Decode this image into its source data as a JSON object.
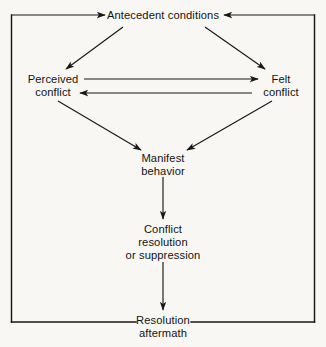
{
  "figure": {
    "background_color": "#f8f7f4",
    "line_color": "#1b1713",
    "text_color": "#16130f"
  },
  "nodes": {
    "antecedent": {
      "id": "antecedent-conditions",
      "lines": [
        "Antecedent conditions"
      ],
      "x": 163,
      "y": 19
    },
    "perceived": {
      "id": "perceived-conflict",
      "lines": [
        "Perceived",
        "conflict"
      ],
      "x": 53,
      "y": 83
    },
    "felt": {
      "id": "felt-conflict",
      "lines": [
        "Felt",
        "conflict"
      ],
      "x": 281,
      "y": 83
    },
    "manifest": {
      "id": "manifest-behavior",
      "lines": [
        "Manifest",
        "behavior"
      ],
      "x": 163,
      "y": 162
    },
    "resolution": {
      "id": "conflict-resolution-or-suppression",
      "lines": [
        "Conflict",
        "resolution",
        "or suppression"
      ],
      "x": 163,
      "y": 233
    },
    "aftermath": {
      "id": "resolution-aftermath",
      "lines": [
        "Resolution",
        "aftermath"
      ],
      "x": 163,
      "y": 324
    }
  },
  "frame": {
    "left": 11.5,
    "right": 314.5,
    "top": 15,
    "bottom": 322,
    "gap_left": 136,
    "gap_right": 191
  },
  "edges": [
    {
      "id": "feedback-left-to-antecedent",
      "label": "Resolution aftermath feeds back to antecedent conditions (left path)",
      "path": "M 11.5 15 L 105 15",
      "arrow": "end"
    },
    {
      "id": "feedback-right-to-antecedent",
      "label": "Resolution aftermath feeds back to antecedent conditions (right path)",
      "path": "M 314.5 15 L 224 15",
      "arrow": "end"
    },
    {
      "id": "antecedent-to-perceived",
      "label": "Antecedent conditions to perceived conflict",
      "path": "M 123 27 L 66 69",
      "arrow": "end"
    },
    {
      "id": "antecedent-to-felt",
      "label": "Antecedent conditions to felt conflict",
      "path": "M 205 27 L 265 69",
      "arrow": "end"
    },
    {
      "id": "perceived-to-felt",
      "label": "Perceived conflict to felt conflict",
      "path": "M 84 79 L 258 79",
      "arrow": "end"
    },
    {
      "id": "felt-to-perceived",
      "label": "Felt conflict to perceived conflict",
      "path": "M 252 93 L 80 93",
      "arrow": "end"
    },
    {
      "id": "perceived-to-manifest",
      "label": "Perceived conflict to manifest behavior",
      "path": "M 58 101 L 141 150",
      "arrow": "end"
    },
    {
      "id": "felt-to-manifest",
      "label": "Felt conflict to manifest behavior",
      "path": "M 272 101 L 187 150",
      "arrow": "end"
    },
    {
      "id": "manifest-to-resolution",
      "label": "Manifest behavior to conflict resolution or suppression",
      "path": "M 163 177 L 163 219",
      "arrow": "end"
    },
    {
      "id": "resolution-to-aftermath",
      "label": "Conflict resolution or suppression to resolution aftermath",
      "path": "M 163 262 L 163 310",
      "arrow": "end"
    }
  ]
}
